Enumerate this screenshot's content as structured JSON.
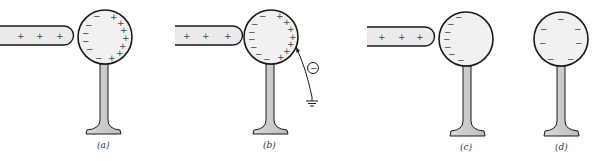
{
  "figure": {
    "colors": {
      "fill": "#ebebeb",
      "stroke": "#1a1a1a",
      "charge": "#444444",
      "background": "#ffffff"
    },
    "panels": [
      {
        "id": "a",
        "label": "(a)",
        "rod": {
          "present": true,
          "charges": [
            "+",
            "+",
            "+"
          ]
        },
        "sphere": {
          "left_charges": [
            "−",
            "−",
            "−",
            "−",
            "−",
            "−"
          ],
          "right_charges": [
            "+",
            "+",
            "+",
            "+",
            "+",
            "+",
            "+",
            "+"
          ]
        },
        "ground_connection": false
      },
      {
        "id": "b",
        "label": "(b)",
        "rod": {
          "present": true,
          "charges": [
            "+",
            "+",
            "+"
          ]
        },
        "sphere": {
          "left_charges": [
            "−",
            "−",
            "−",
            "−",
            "−",
            "−",
            "−"
          ],
          "right_charges": [
            "+",
            "+",
            "+",
            "+",
            "+",
            "+",
            "+",
            "+"
          ]
        },
        "ground_connection": true,
        "electron_symbol": "−"
      },
      {
        "id": "c",
        "label": "(c)",
        "rod": {
          "present": true,
          "charges": [
            "+",
            "+",
            "+"
          ]
        },
        "sphere": {
          "left_charges": [
            "−",
            "−",
            "−",
            "−",
            "−",
            "−",
            "−"
          ],
          "right_charges": []
        },
        "ground_connection": false
      },
      {
        "id": "d",
        "label": "(d)",
        "rod": {
          "present": false,
          "charges": []
        },
        "sphere": {
          "distributed_charges": [
            "−",
            "−",
            "−",
            "−",
            "−",
            "−",
            "−"
          ]
        },
        "ground_connection": false
      }
    ]
  }
}
